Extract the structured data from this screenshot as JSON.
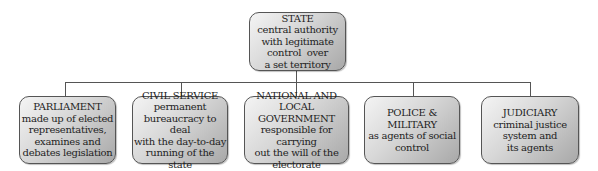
{
  "diagram": {
    "type": "org-chart",
    "root": {
      "title": "STATE",
      "lines": [
        "central authority",
        "with legitimate",
        "control  over",
        "a set territory"
      ]
    },
    "children": [
      {
        "title": "PARLIAMENT",
        "lines": [
          "made up of elected",
          "representatives,",
          "examines and",
          "debates legislation"
        ]
      },
      {
        "title": "CIVIL SERVICE",
        "lines": [
          "permanent",
          "bureaucracy to deal",
          "with the day-to-day",
          "running of the state"
        ]
      },
      {
        "title": "NATIONAL AND",
        "title2": "LOCAL GOVERNMENT",
        "lines": [
          "responsible for carrying",
          "out the will of the",
          "electorate"
        ]
      },
      {
        "title": "POLICE &",
        "title2": "MILITARY",
        "lines": [
          "as agents of social",
          "control"
        ]
      },
      {
        "title": "JUDICIARY",
        "lines": [
          "criminal justice",
          "system and",
          "its agents"
        ]
      }
    ],
    "colors": {
      "box_light": "#f4f4f4",
      "box_dark": "#a8a8a8",
      "border": "#555555",
      "text": "#1e1e1e"
    }
  }
}
